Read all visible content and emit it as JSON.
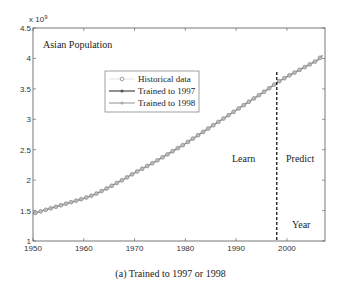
{
  "chart_data": {
    "type": "line",
    "title": "Asian Population",
    "xlabel": "Year",
    "ylabel": "",
    "y_exponent_label": "x 10^9",
    "xlim": [
      1950,
      2007.5
    ],
    "ylim": [
      1,
      4.5
    ],
    "x_ticks": [
      1950,
      1960,
      1970,
      1980,
      1990,
      2000
    ],
    "y_ticks": [
      1,
      1.5,
      2,
      2.5,
      3,
      3.5,
      4,
      4.5
    ],
    "grid": false,
    "legend_position": "upper-left-center",
    "annotations": [
      "Learn",
      "Predict",
      "Year"
    ],
    "split_line_x": 1998,
    "x": [
      1950,
      1952,
      1954,
      1956,
      1958,
      1960,
      1962,
      1964,
      1966,
      1968,
      1970,
      1972,
      1974,
      1976,
      1978,
      1980,
      1982,
      1984,
      1986,
      1988,
      1990,
      1992,
      1994,
      1996,
      1998,
      2000,
      2002,
      2004,
      2006,
      2007
    ],
    "series": [
      {
        "name": "Historical data",
        "marker": "circle",
        "values": [
          1.45,
          1.5,
          1.55,
          1.6,
          1.65,
          1.7,
          1.76,
          1.84,
          1.93,
          2.02,
          2.12,
          2.21,
          2.3,
          2.4,
          2.5,
          2.6,
          2.71,
          2.82,
          2.93,
          3.04,
          3.15,
          3.26,
          3.37,
          3.48,
          3.6,
          3.7,
          3.79,
          3.88,
          3.97,
          4.05
        ]
      },
      {
        "name": "Trained to 1997",
        "marker": "dot-line-dark",
        "values": [
          1.45,
          1.5,
          1.55,
          1.6,
          1.65,
          1.7,
          1.76,
          1.84,
          1.93,
          2.02,
          2.12,
          2.21,
          2.3,
          2.4,
          2.5,
          2.6,
          2.71,
          2.82,
          2.93,
          3.04,
          3.15,
          3.26,
          3.37,
          3.48,
          3.6,
          3.7,
          3.79,
          3.88,
          3.97,
          4.05
        ]
      },
      {
        "name": "Trained to 1998",
        "marker": "dot-line-light",
        "values": [
          1.45,
          1.5,
          1.55,
          1.6,
          1.65,
          1.7,
          1.76,
          1.84,
          1.93,
          2.02,
          2.12,
          2.21,
          2.3,
          2.4,
          2.5,
          2.6,
          2.71,
          2.82,
          2.93,
          3.04,
          3.15,
          3.26,
          3.37,
          3.48,
          3.6,
          3.7,
          3.79,
          3.88,
          3.97,
          4.05
        ]
      }
    ]
  },
  "labels": {
    "title": "Asian Population",
    "exponent": "x 10",
    "exponent_power": "9",
    "learn": "Learn",
    "predict": "Predict",
    "xlabel": "Year",
    "caption": "(a) Trained to 1997 or 1998"
  },
  "legend": [
    {
      "label": "Historical data"
    },
    {
      "label": "Trained to 1997"
    },
    {
      "label": "Trained to 1998"
    }
  ],
  "colors": {
    "historical": "#8a8a8a",
    "trained_1997": "#555555",
    "trained_1998": "#a8a8a8",
    "split_line": "#222222",
    "axis": "#555555"
  }
}
